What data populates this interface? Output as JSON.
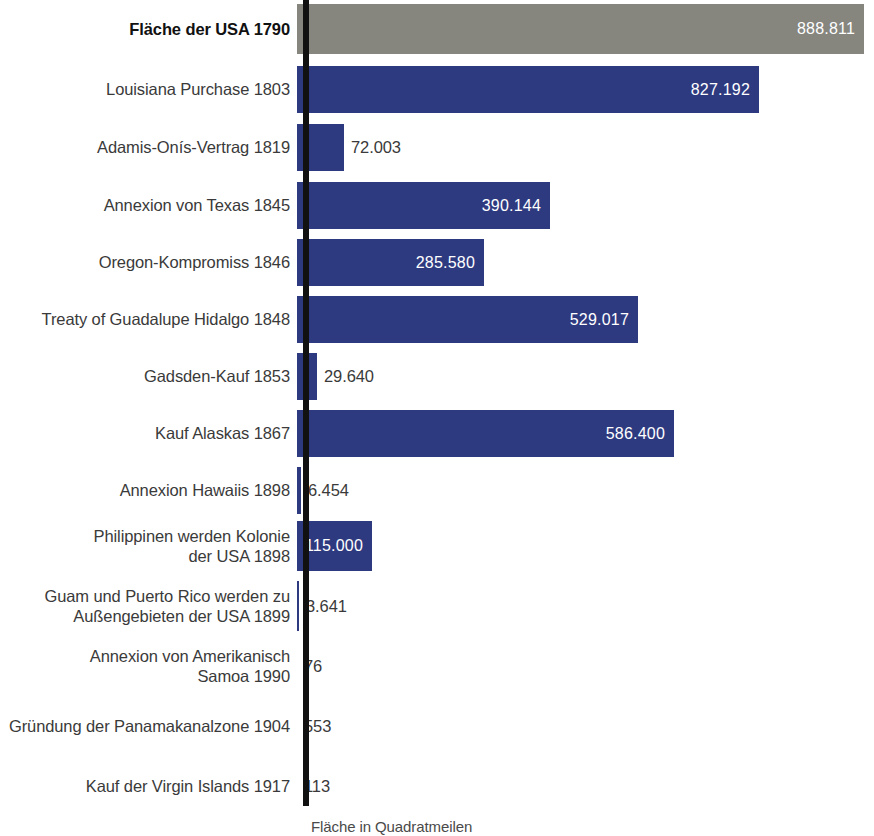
{
  "chart_data": {
    "type": "bar",
    "orientation": "horizontal",
    "title": "",
    "xlabel": "Fläche in Quadratmeilen",
    "ylabel": "",
    "xlim": [
      0,
      888811
    ],
    "grid": false,
    "legend": null,
    "value_number_format": "de-DE (dot as thousands separator)",
    "categories": [
      "Fläche der USA 1790",
      "Louisiana Purchase 1803",
      "Adamis-Onís-Vertrag 1819",
      "Annexion von Texas 1845",
      "Oregon-Kompromiss 1846",
      "Treaty of Guadalupe Hidalgo 1848",
      "Gadsden-Kauf 1853",
      "Kauf Alaskas 1867",
      "Annexion Hawaiis 1898",
      "Philippinen werden Kolonie der USA 1898",
      "Guam und Puerto Rico werden zu Außengebieten der USA 1899",
      "Annexion von Amerikanisch Samoa 1990",
      "Gründung der Panamakanalzone 1904",
      "Kauf der Virgin Islands 1917"
    ],
    "values": [
      888811,
      827192,
      72003,
      390144,
      285580,
      529017,
      29640,
      586400,
      6454,
      115000,
      3641,
      76,
      553,
      113
    ],
    "value_labels": [
      "888.811",
      "827.192",
      "72.003",
      "390.144",
      "285.580",
      "529.017",
      "29.640",
      "586.400",
      "6.454",
      "115.000",
      "3.641",
      "76",
      "553",
      "113"
    ],
    "colors": {
      "baseline_bar": "#86867f",
      "acquisition_bar": "#2e3a80",
      "axis_line": "#111111",
      "label_text": "#3a3a3a",
      "value_text_inside": "#ffffff",
      "value_text_outside": "#3a3a3a",
      "background": "#ffffff"
    }
  },
  "rows": [
    {
      "label": "Fläche der USA 1790",
      "value_label": "888.811",
      "value": 888811,
      "highlight": true,
      "color": "#86867f",
      "label_inside": true,
      "row_height": 50,
      "row_top": 4,
      "bar_width": 567
    },
    {
      "label": "Louisiana Purchase 1803",
      "value_label": "827.192",
      "value": 827192,
      "highlight": false,
      "color": "#2e3a80",
      "label_inside": true,
      "row_height": 47,
      "row_top": 66,
      "bar_width": 462
    },
    {
      "label": "Adamis-Onís-Vertrag 1819",
      "value_label": "72.003",
      "value": 72003,
      "highlight": false,
      "color": "#2e3a80",
      "label_inside": false,
      "row_height": 47,
      "row_top": 124,
      "bar_width": 47
    },
    {
      "label": "Annexion von Texas 1845",
      "value_label": "390.144",
      "value": 390144,
      "highlight": false,
      "color": "#2e3a80",
      "label_inside": true,
      "row_height": 47,
      "row_top": 182,
      "bar_width": 253
    },
    {
      "label": "Oregon-Kompromiss 1846",
      "value_label": "285.580",
      "value": 285580,
      "highlight": false,
      "color": "#2e3a80",
      "label_inside": true,
      "row_height": 47,
      "row_top": 239,
      "bar_width": 187
    },
    {
      "label": "Treaty of Guadalupe Hidalgo 1848",
      "value_label": "529.017",
      "value": 529017,
      "highlight": false,
      "color": "#2e3a80",
      "label_inside": true,
      "row_height": 47,
      "row_top": 296,
      "bar_width": 341
    },
    {
      "label": "Gadsden-Kauf 1853",
      "value_label": "29.640",
      "value": 29640,
      "highlight": false,
      "color": "#2e3a80",
      "label_inside": false,
      "row_height": 47,
      "row_top": 353,
      "bar_width": 20
    },
    {
      "label": "Kauf Alaskas 1867",
      "value_label": "586.400",
      "value": 586400,
      "highlight": false,
      "color": "#2e3a80",
      "label_inside": true,
      "row_height": 47,
      "row_top": 410,
      "bar_width": 377
    },
    {
      "label": "Annexion Hawaiis 1898",
      "value_label": "6.454",
      "value": 6454,
      "highlight": false,
      "color": "#2e3a80",
      "label_inside": false,
      "row_height": 47,
      "row_top": 467,
      "bar_width": 4
    },
    {
      "label": "Philippinen werden Kolonie\nder USA 1898",
      "value_label": "115.000",
      "value": 115000,
      "highlight": false,
      "color": "#2e3a80",
      "label_inside": true,
      "row_height": 50,
      "row_top": 521,
      "bar_width": 75
    },
    {
      "label": "Guam und Puerto Rico werden zu\nAußengebieten der USA 1899",
      "value_label": "3.641",
      "value": 3641,
      "highlight": false,
      "color": "#2e3a80",
      "label_inside": false,
      "row_height": 50,
      "row_top": 581,
      "bar_width": 2
    },
    {
      "label": "Annexion von Amerikanisch\nSamoa 1990",
      "value_label": "76",
      "value": 76,
      "highlight": false,
      "color": "#2e3a80",
      "label_inside": false,
      "row_height": 50,
      "row_top": 641,
      "bar_width": 0
    },
    {
      "label": "Gründung der Panamakanalzone 1904",
      "value_label": "553",
      "value": 553,
      "highlight": false,
      "color": "#2e3a80",
      "label_inside": false,
      "row_height": 47,
      "row_top": 703,
      "bar_width": 0
    },
    {
      "label": "Kauf der Virgin Islands 1917",
      "value_label": "113",
      "value": 113,
      "highlight": false,
      "color": "#2e3a80",
      "label_inside": false,
      "row_height": 47,
      "row_top": 763,
      "bar_width": 0
    }
  ],
  "caption": "Fläche in Quadratmeilen"
}
